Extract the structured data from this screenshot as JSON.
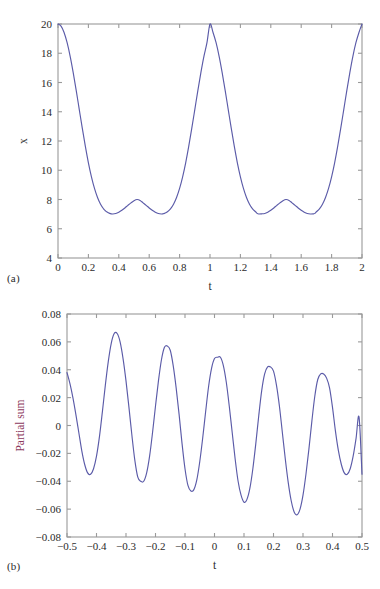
{
  "figure": {
    "background": "#ffffff",
    "line_color": "#5b5ba8"
  },
  "panels": [
    {
      "tag": "(a)",
      "tag_name": "panel-a-tag"
    },
    {
      "tag": "(b)",
      "tag_name": "panel-b-tag"
    }
  ],
  "chart_data": [
    {
      "type": "line",
      "panel": "(a)",
      "title": "",
      "xlabel": "t",
      "ylabel": "x",
      "xlim": [
        0,
        2
      ],
      "ylim": [
        4,
        20
      ],
      "grid": false,
      "legend": null,
      "xticks": [
        "0",
        "0.2",
        "0.4",
        "0.6",
        "0.8",
        "1",
        "1.2",
        "1.4",
        "1.6",
        "1.8",
        "2"
      ],
      "xtick_values": [
        0,
        0.2,
        0.4,
        0.6,
        0.8,
        1,
        1.2,
        1.4,
        1.6,
        1.8,
        2
      ],
      "yticks": [
        "4",
        "6",
        "8",
        "10",
        "12",
        "14",
        "16",
        "18",
        "20"
      ],
      "ytick_values": [
        4,
        6,
        8,
        10,
        12,
        14,
        16,
        18,
        20
      ],
      "line_color": "#5b5ba8",
      "series": [
        {
          "name": "x(t)",
          "x": [
            0,
            0.02,
            0.04,
            0.06,
            0.08,
            0.1,
            0.12,
            0.14,
            0.16,
            0.18,
            0.2,
            0.22,
            0.24,
            0.26,
            0.28,
            0.3,
            0.31,
            0.32,
            0.34,
            0.36,
            0.38,
            0.4,
            0.42,
            0.44,
            0.46,
            0.48,
            0.5,
            0.52,
            0.54,
            0.56,
            0.58,
            0.6,
            0.62,
            0.64,
            0.66,
            0.68,
            0.69,
            0.7,
            0.72,
            0.74,
            0.76,
            0.78,
            0.8,
            0.82,
            0.84,
            0.86,
            0.88,
            0.9,
            0.92,
            0.94,
            0.96,
            0.98,
            1.0,
            1.02,
            1.04,
            1.06,
            1.08,
            1.1,
            1.12,
            1.14,
            1.16,
            1.18,
            1.2,
            1.22,
            1.24,
            1.26,
            1.28,
            1.3,
            1.31,
            1.32,
            1.34,
            1.36,
            1.38,
            1.4,
            1.42,
            1.44,
            1.46,
            1.48,
            1.5,
            1.52,
            1.54,
            1.56,
            1.58,
            1.6,
            1.62,
            1.64,
            1.66,
            1.68,
            1.69,
            1.7,
            1.72,
            1.74,
            1.76,
            1.78,
            1.8,
            1.82,
            1.84,
            1.86,
            1.88,
            1.9,
            1.92,
            1.94,
            1.96,
            1.98,
            2.0
          ],
          "y": [
            20.0,
            19.85,
            19.42,
            18.72,
            17.79,
            16.68,
            15.45,
            14.15,
            12.86,
            11.63,
            10.51,
            9.55,
            8.76,
            8.14,
            7.68,
            7.36,
            7.25,
            7.16,
            7.05,
            7.01,
            7.04,
            7.13,
            7.26,
            7.42,
            7.6,
            7.77,
            7.92,
            8.0,
            7.94,
            7.77,
            7.6,
            7.42,
            7.26,
            7.13,
            7.04,
            7.01,
            7.02,
            7.05,
            7.16,
            7.36,
            7.68,
            8.14,
            8.76,
            9.55,
            10.51,
            11.63,
            12.86,
            14.15,
            15.45,
            16.68,
            17.79,
            18.72,
            20.0,
            19.42,
            18.72,
            17.79,
            16.68,
            15.45,
            14.15,
            12.86,
            11.63,
            10.51,
            9.55,
            8.76,
            8.14,
            7.68,
            7.36,
            7.16,
            7.05,
            7.01,
            7.02,
            7.04,
            7.13,
            7.26,
            7.42,
            7.6,
            7.77,
            7.92,
            8.0,
            7.94,
            7.77,
            7.6,
            7.42,
            7.26,
            7.13,
            7.04,
            7.01,
            7.02,
            7.05,
            7.16,
            7.36,
            7.68,
            8.14,
            8.76,
            9.55,
            10.51,
            11.63,
            12.86,
            14.15,
            15.45,
            16.68,
            17.79,
            18.72,
            19.42,
            20.0
          ],
          "description": "Smooth periodic curve with period 1: maxima of 20 at t=0,1,2; local maxima of 8 at t=0.5 and t=1.5; minima near 4.9 at t=0.31, 0.69, 1.31, 1.69"
        }
      ],
      "key_points": {
        "maxima": [
          {
            "t": 0,
            "x": 20
          },
          {
            "t": 1,
            "x": 20
          },
          {
            "t": 2,
            "x": 20
          }
        ],
        "local_maxima": [
          {
            "t": 0.5,
            "x": 8
          },
          {
            "t": 1.5,
            "x": 8
          }
        ],
        "minima": [
          {
            "t": 0.31,
            "x": 4.9
          },
          {
            "t": 0.69,
            "x": 4.9
          },
          {
            "t": 1.31,
            "x": 4.9
          },
          {
            "t": 1.69,
            "x": 4.9
          }
        ]
      }
    },
    {
      "type": "line",
      "panel": "(b)",
      "title": "",
      "xlabel": "t",
      "ylabel": "Partial sum",
      "xlim": [
        -0.5,
        0.5
      ],
      "ylim": [
        -0.08,
        0.08
      ],
      "grid": false,
      "legend": null,
      "xticks": [
        "−0.5",
        "−0.4",
        "−0.3",
        "−0.2",
        "−0.1",
        "0",
        "0.1",
        "0.2",
        "0.3",
        "0.4",
        "0.5"
      ],
      "xtick_values": [
        -0.5,
        -0.4,
        -0.3,
        -0.2,
        -0.1,
        0,
        0.1,
        0.2,
        0.3,
        0.4,
        0.5
      ],
      "yticks": [
        "−0.08",
        "−0.06",
        "−0.04",
        "−0.02",
        "0",
        "0.02",
        "0.04",
        "0.06",
        "0.08"
      ],
      "ytick_values": [
        -0.08,
        -0.06,
        -0.04,
        -0.02,
        0,
        0.02,
        0.04,
        0.06,
        0.08
      ],
      "line_color": "#5b5ba8",
      "series": [
        {
          "name": "Partial sum",
          "x": [
            -0.5,
            -0.49,
            -0.48,
            -0.47,
            -0.46,
            -0.45,
            -0.44,
            -0.43,
            -0.42,
            -0.41,
            -0.4,
            -0.39,
            -0.38,
            -0.37,
            -0.36,
            -0.35,
            -0.34,
            -0.33,
            -0.32,
            -0.31,
            -0.3,
            -0.29,
            -0.28,
            -0.27,
            -0.26,
            -0.25,
            -0.24,
            -0.23,
            -0.22,
            -0.21,
            -0.2,
            -0.19,
            -0.18,
            -0.17,
            -0.16,
            -0.15,
            -0.14,
            -0.13,
            -0.12,
            -0.11,
            -0.1,
            -0.09,
            -0.08,
            -0.07,
            -0.06,
            -0.05,
            -0.04,
            -0.03,
            -0.02,
            -0.01,
            0.0,
            0.01,
            0.02,
            0.03,
            0.04,
            0.05,
            0.06,
            0.07,
            0.08,
            0.09,
            0.1,
            0.11,
            0.12,
            0.13,
            0.14,
            0.15,
            0.16,
            0.17,
            0.18,
            0.19,
            0.2,
            0.21,
            0.22,
            0.23,
            0.24,
            0.25,
            0.26,
            0.27,
            0.28,
            0.29,
            0.3,
            0.31,
            0.32,
            0.33,
            0.34,
            0.35,
            0.36,
            0.37,
            0.38,
            0.39,
            0.4,
            0.41,
            0.42,
            0.43,
            0.44,
            0.45,
            0.46,
            0.47,
            0.48,
            0.49,
            0.5
          ],
          "y": [
            0.038,
            0.03,
            0.02,
            0.008,
            -0.005,
            -0.018,
            -0.028,
            -0.034,
            -0.035,
            -0.031,
            -0.022,
            -0.008,
            0.01,
            0.029,
            0.046,
            0.059,
            0.066,
            0.066,
            0.06,
            0.048,
            0.032,
            0.013,
            -0.007,
            -0.025,
            -0.037,
            -0.04,
            -0.04,
            -0.034,
            -0.022,
            -0.005,
            0.014,
            0.032,
            0.047,
            0.056,
            0.057,
            0.054,
            0.043,
            0.027,
            0.008,
            -0.013,
            -0.031,
            -0.043,
            -0.047,
            -0.046,
            -0.039,
            -0.026,
            -0.009,
            0.01,
            0.028,
            0.041,
            0.048,
            0.049,
            0.049,
            0.043,
            0.031,
            0.014,
            -0.005,
            -0.024,
            -0.04,
            -0.05,
            -0.055,
            -0.053,
            -0.045,
            -0.031,
            -0.013,
            0.007,
            0.025,
            0.037,
            0.042,
            0.042,
            0.039,
            0.029,
            0.014,
            -0.005,
            -0.024,
            -0.041,
            -0.054,
            -0.062,
            -0.064,
            -0.06,
            -0.05,
            -0.035,
            -0.017,
            0.003,
            0.021,
            0.033,
            0.037,
            0.037,
            0.034,
            0.027,
            0.013,
            -0.004,
            -0.018,
            -0.028,
            -0.034,
            -0.035,
            -0.031,
            -0.022,
            -0.009,
            0.006,
            -0.035
          ],
          "description": "Oscillatory Gibbs-type partial sum, 5 full oscillations, amplitude of positive peaks decreasing left-to-right (0.066, 0.057, 0.049, 0.042, 0.037) and negative troughs deepening (-0.035, -0.040, -0.047, -0.055, -0.064)"
        }
      ],
      "key_points": {
        "positive_peaks": [
          {
            "t": -0.345,
            "y": 0.066
          },
          {
            "t": -0.155,
            "y": 0.057
          },
          {
            "t": 0.045,
            "y": 0.049
          },
          {
            "t": 0.245,
            "y": 0.042
          },
          {
            "t": 0.44,
            "y": 0.037
          }
        ],
        "negative_troughs": [
          {
            "t": -0.44,
            "y": -0.035
          },
          {
            "t": -0.25,
            "y": -0.04
          },
          {
            "t": -0.055,
            "y": -0.047
          },
          {
            "t": 0.15,
            "y": -0.055
          },
          {
            "t": 0.345,
            "y": -0.064
          }
        ],
        "endpoints": [
          {
            "t": -0.5,
            "y": 0.038
          },
          {
            "t": 0.5,
            "y": -0.035
          }
        ]
      }
    }
  ]
}
